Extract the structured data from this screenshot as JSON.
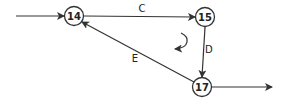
{
  "diagram": {
    "type": "network-loop",
    "colors": {
      "stroke": "#333333",
      "background": "#ffffff"
    },
    "nodes": [
      {
        "id": "14",
        "label": "14"
      },
      {
        "id": "15",
        "label": "15"
      },
      {
        "id": "17",
        "label": "17"
      }
    ],
    "edges": [
      {
        "from": "in",
        "to": "14",
        "label": ""
      },
      {
        "from": "14",
        "to": "15",
        "label": "C"
      },
      {
        "from": "15",
        "to": "17",
        "label": "D"
      },
      {
        "from": "17",
        "to": "14",
        "label": "E"
      },
      {
        "from": "17",
        "to": "out",
        "label": ""
      }
    ],
    "loop_direction_icon": "counterclockwise-arrow"
  }
}
